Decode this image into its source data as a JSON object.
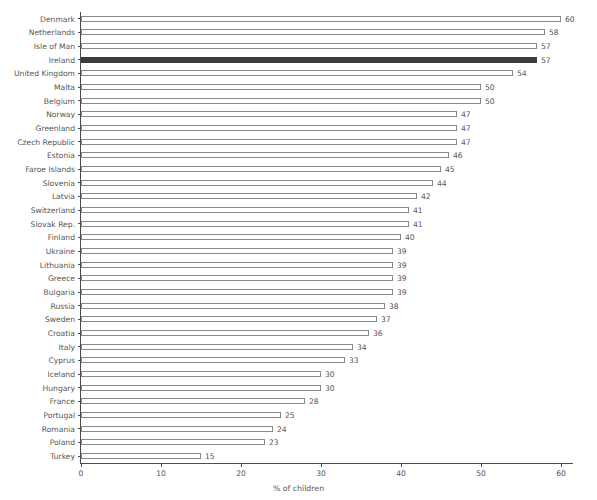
{
  "chart_data": {
    "type": "bar",
    "orientation": "horizontal",
    "title": "",
    "xlabel": "% of children",
    "ylabel": "",
    "xlim": [
      0,
      60
    ],
    "xticks": [
      0,
      10,
      20,
      30,
      40,
      50,
      60
    ],
    "xtick_labels": [
      "0",
      "10",
      "20",
      "30",
      "40",
      "50",
      "60"
    ],
    "grid": false,
    "legend": null,
    "highlight_category": "Ireland",
    "colors": {
      "bar_fill": "#ffffff",
      "bar_stroke": "#888888",
      "highlight_fill": "#3b3b3b",
      "axis": "#4d4d4d",
      "text": "#555555",
      "background": "#ffffff"
    },
    "categories": [
      "Denmark",
      "Netherlands",
      "Isle of Man",
      "Ireland",
      "United Kingdom",
      "Malta",
      "Belgium",
      "Norway",
      "Greenland",
      "Czech Republic",
      "Estonia",
      "Faroe Islands",
      "Slovenia",
      "Latvia",
      "Switzerland",
      "Slovak Rep.",
      "Finland",
      "Ukraine",
      "Lithuania",
      "Greece",
      "Bulgaria",
      "Russia",
      "Sweden",
      "Croatia",
      "Italy",
      "Cyprus",
      "Iceland",
      "Hungary",
      "France",
      "Portugal",
      "Romania",
      "Poland",
      "Turkey"
    ],
    "values": [
      60,
      58,
      57,
      57,
      54,
      50,
      50,
      47,
      47,
      47,
      46,
      45,
      44,
      42,
      41,
      41,
      40,
      39,
      39,
      39,
      39,
      38,
      37,
      36,
      34,
      33,
      30,
      30,
      28,
      25,
      24,
      23,
      15
    ],
    "value_labels": [
      "60",
      "58",
      "57",
      "57",
      "54",
      "50",
      "50",
      "47",
      "47",
      "47",
      "46",
      "45",
      "44",
      "42",
      "41",
      "41",
      "40",
      "39",
      "39",
      "39",
      "39",
      "38",
      "37",
      "36",
      "34",
      "33",
      "30",
      "30",
      "28",
      "25",
      "24",
      "23",
      "15"
    ]
  }
}
